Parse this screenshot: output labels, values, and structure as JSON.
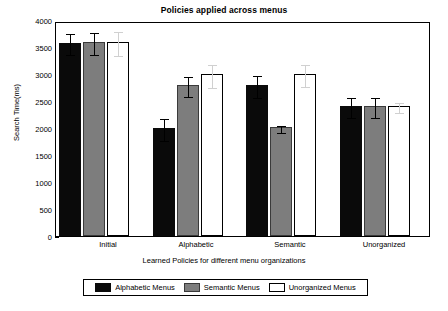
{
  "chart_data": {
    "type": "bar",
    "title": "Policies applied across menus",
    "xlabel": "Learned Policies for different menu organizations",
    "ylabel": "Search Time(ms)",
    "ylim": [
      0,
      4000
    ],
    "ytick_labels": [
      "0",
      "500",
      "1000",
      "1500",
      "2000",
      "2500",
      "3000",
      "3500",
      "4000"
    ],
    "ytick_values": [
      0,
      500,
      1000,
      1500,
      2000,
      2500,
      3000,
      3500,
      4000
    ],
    "grid": false,
    "legend_position": "below-axes",
    "categories": [
      "Initial",
      "Alphabetic",
      "Semantic",
      "Unorganized"
    ],
    "series": [
      {
        "name": "Alphabetic Menus",
        "color": "#0a0a0a",
        "values": [
          3600,
          2010,
          2810,
          2420
        ],
        "errors": [
          200,
          210,
          200,
          180
        ]
      },
      {
        "name": "Semantic Menus",
        "color": "#7d7d7d",
        "values": [
          3610,
          2810,
          2020,
          2420
        ],
        "errors": [
          200,
          190,
          60,
          190
        ]
      },
      {
        "name": "Unorganized Menus",
        "color": "#ffffff",
        "values": [
          3610,
          3005,
          3010,
          2420
        ],
        "errors": [
          215,
          215,
          200,
          90
        ]
      }
    ]
  },
  "legend": {
    "entries": [
      {
        "label": "Alphabetic Menus"
      },
      {
        "label": "Semantic Menus"
      },
      {
        "label": "Unorganized Menus"
      }
    ]
  }
}
